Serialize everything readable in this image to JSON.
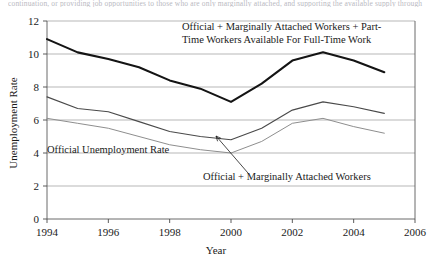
{
  "figure": {
    "cut_off_text_above": "continuation, or providing job opportunities to those who are only marginally attached, and supporting the available supply through",
    "background_color": "#ffffff"
  },
  "chart_data": {
    "type": "line",
    "title": "",
    "xlabel": "Year",
    "ylabel": "Unemployment Rate",
    "xlim": [
      1994,
      2006
    ],
    "ylim": [
      0,
      12
    ],
    "xticks": [
      1994,
      1996,
      1998,
      2000,
      2002,
      2004,
      2006
    ],
    "yticks": [
      0,
      2,
      4,
      6,
      8,
      10,
      12
    ],
    "xtick_labels": [
      "1994",
      "1996",
      "1998",
      "2000",
      "2002",
      "2004",
      "2006"
    ],
    "ytick_labels": [
      "0",
      "2",
      "4",
      "6",
      "8",
      "10",
      "12"
    ],
    "grid": true,
    "grid_axis": "y",
    "legend": "none",
    "x": [
      1994,
      1995,
      1996,
      1997,
      1998,
      1999,
      2000,
      2001,
      2002,
      2003,
      2004,
      2005
    ],
    "series": [
      {
        "name": "Official + Marginally Attached Workers + Part-Time Workers Available For Full-Time Work",
        "short_name": "broad-u6",
        "color": "#141414",
        "width": 2.1,
        "values": [
          10.9,
          10.1,
          9.7,
          9.2,
          8.4,
          7.9,
          7.1,
          8.2,
          9.6,
          10.1,
          9.6,
          8.9
        ]
      },
      {
        "name": "Official + Marginally Attached Workers",
        "short_name": "official-plus-marginal",
        "color": "#4a4a4a",
        "width": 1.15,
        "values": [
          7.4,
          6.7,
          6.5,
          5.9,
          5.3,
          5.0,
          4.8,
          5.5,
          6.6,
          7.1,
          6.8,
          6.4
        ]
      },
      {
        "name": "Official Unemployment Rate",
        "short_name": "official",
        "color": "#8e8e8e",
        "width": 1.0,
        "values": [
          6.1,
          5.8,
          5.5,
          5.0,
          4.5,
          4.2,
          4.0,
          4.7,
          5.8,
          6.1,
          5.6,
          5.2
        ]
      }
    ],
    "annotations": [
      {
        "name": "broad-u6-label",
        "lines": [
          "Official + Marginally Attached Workers +  Part-",
          "Time Workers Available For Full-Time Work"
        ],
        "x_px": 182,
        "y_px": 30,
        "anchor": "start"
      },
      {
        "name": "official-rate-label",
        "lines": [
          "Official Unemployment Rate"
        ],
        "x_px": 47,
        "y_px": 153,
        "anchor": "start"
      },
      {
        "name": "official-plus-marginal-label",
        "lines": [
          "Official + Marginally Attached Workers"
        ],
        "x_px": 203,
        "y_px": 180,
        "anchor": "start"
      }
    ],
    "leader_line": {
      "name": "official-plus-marginal-leader",
      "from_px": [
        248,
        173
      ],
      "to_px": [
        216,
        136
      ]
    }
  }
}
